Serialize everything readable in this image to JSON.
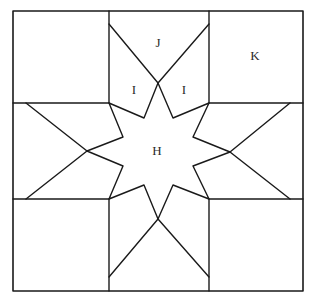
{
  "diagram": {
    "type": "quilt-block",
    "labels": {
      "star_center": "H",
      "top_left_side_piece": "I",
      "top_right_side_piece": "I",
      "top_middle_piece": "J",
      "corner_square": "K"
    },
    "colors": {
      "line": "#1a1a1a",
      "background": "#ffffff",
      "text": "#2a2a2a"
    }
  }
}
